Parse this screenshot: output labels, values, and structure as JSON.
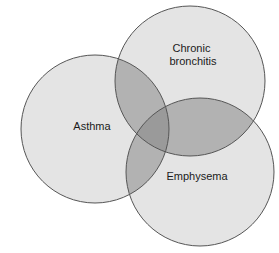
{
  "diagram": {
    "type": "venn-3-circle",
    "background_color": "#ffffff",
    "stroke_color": "#555555",
    "stroke_width": 1,
    "fill_single": "#e4e4e4",
    "fill_pair": "#b2b2b2",
    "fill_triple": "#9a9a9a",
    "label_color": "#1b1b1b",
    "sets": [
      {
        "id": "asthma",
        "label": "Asthma",
        "label_lines": [
          "Asthma"
        ],
        "cx": 95,
        "cy": 129,
        "r": 74,
        "label_x": 92,
        "label_y": 127
      },
      {
        "id": "chronic-bronchitis",
        "label": "Chronic bronchitis",
        "label_lines": [
          "Chronic",
          "bronchitis"
        ],
        "cx": 190,
        "cy": 81,
        "r": 75,
        "label_x": 193,
        "label_y": 49
      },
      {
        "id": "emphysema",
        "label": "Emphysema",
        "label_lines": [
          "Emphysema"
        ],
        "cx": 200,
        "cy": 172,
        "r": 74,
        "label_x": 197,
        "label_y": 177
      }
    ]
  }
}
